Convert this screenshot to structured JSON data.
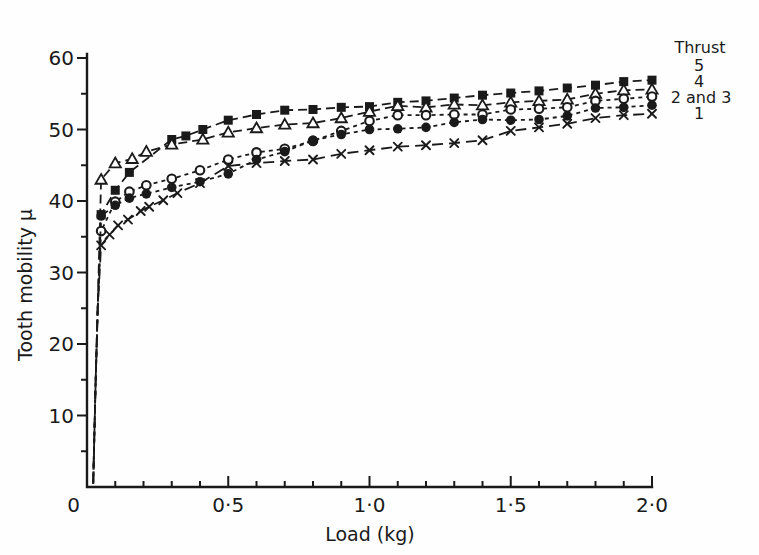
{
  "figure": {
    "background": "#fefefe",
    "ink_color": "#1a1a1a"
  },
  "legend": {
    "title": "Thrust",
    "entries": [
      {
        "label": "5"
      },
      {
        "label": "4"
      },
      {
        "label": "2 and 3"
      },
      {
        "label": "1"
      }
    ]
  },
  "axes": {
    "x": {
      "origin_label": "0",
      "major_tick_labels": [
        "0·5",
        "1·0",
        "1·5",
        "2·0"
      ],
      "major_ticks": [
        0.5,
        1.0,
        1.5,
        2.0
      ],
      "minor_tick_step": 0.1
    },
    "y": {
      "major_tick_labels": [
        "10",
        "20",
        "30",
        "40",
        "50",
        "60"
      ],
      "major_ticks": [
        10,
        20,
        30,
        40,
        50,
        60
      ],
      "minor_tick_step": 5
    }
  },
  "chart_data": {
    "type": "line",
    "title": "",
    "xlabel": "Load (kg)",
    "ylabel": "Tooth mobility μ",
    "xlim": [
      0,
      2.0
    ],
    "ylim": [
      0,
      60
    ],
    "grid": false,
    "legend_position": "top-right",
    "lead_in_points": [
      [
        0.022,
        0.5
      ],
      [
        0.03,
        14
      ],
      [
        0.038,
        25
      ]
    ],
    "series": [
      {
        "name": "Thrust 5",
        "legend_label": "5",
        "marker": "filled-square",
        "dash": [
          9,
          5
        ],
        "points": [
          [
            0.05,
            38.1
          ],
          [
            0.1,
            41.5
          ],
          [
            0.15,
            44.0
          ],
          [
            0.3,
            48.6
          ],
          [
            0.35,
            49.1
          ],
          [
            0.41,
            50.0
          ],
          [
            0.5,
            51.3
          ],
          [
            0.6,
            52.1
          ],
          [
            0.7,
            52.7
          ],
          [
            0.8,
            52.8
          ],
          [
            0.9,
            53.1
          ],
          [
            1.0,
            53.2
          ],
          [
            1.1,
            53.8
          ],
          [
            1.2,
            54.0
          ],
          [
            1.3,
            54.4
          ],
          [
            1.4,
            54.8
          ],
          [
            1.5,
            55.1
          ],
          [
            1.6,
            55.4
          ],
          [
            1.7,
            55.8
          ],
          [
            1.8,
            56.2
          ],
          [
            1.9,
            56.7
          ],
          [
            2.0,
            56.9
          ]
        ]
      },
      {
        "name": "Thrust 4",
        "legend_label": "4",
        "marker": "open-triangle",
        "dash": [
          9,
          5
        ],
        "points": [
          [
            0.05,
            43.0
          ],
          [
            0.1,
            45.3
          ],
          [
            0.16,
            45.9
          ],
          [
            0.21,
            46.9
          ],
          [
            0.3,
            47.9
          ],
          [
            0.41,
            48.6
          ],
          [
            0.5,
            49.6
          ],
          [
            0.6,
            50.2
          ],
          [
            0.7,
            50.7
          ],
          [
            0.8,
            50.9
          ],
          [
            0.9,
            51.6
          ],
          [
            1.0,
            52.5
          ],
          [
            1.1,
            53.3
          ],
          [
            1.2,
            53.1
          ],
          [
            1.3,
            53.5
          ],
          [
            1.4,
            53.4
          ],
          [
            1.5,
            53.8
          ],
          [
            1.6,
            54.0
          ],
          [
            1.7,
            54.2
          ],
          [
            1.8,
            55.0
          ],
          [
            1.9,
            55.5
          ],
          [
            2.0,
            55.6
          ]
        ]
      },
      {
        "name": "Thrust 2 and 3 (open circle)",
        "legend_label": "2 and 3",
        "marker": "open-circle",
        "dash": [
          4,
          4
        ],
        "points": [
          [
            0.05,
            35.8
          ],
          [
            0.1,
            39.9
          ],
          [
            0.15,
            41.3
          ],
          [
            0.21,
            42.2
          ],
          [
            0.3,
            43.1
          ],
          [
            0.4,
            44.3
          ],
          [
            0.5,
            45.8
          ],
          [
            0.6,
            46.8
          ],
          [
            0.7,
            47.3
          ],
          [
            0.8,
            48.4
          ],
          [
            0.9,
            49.8
          ],
          [
            1.0,
            51.2
          ],
          [
            1.1,
            52.0
          ],
          [
            1.2,
            52.0
          ],
          [
            1.3,
            52.1
          ],
          [
            1.4,
            52.1
          ],
          [
            1.5,
            52.8
          ],
          [
            1.6,
            52.9
          ],
          [
            1.7,
            53.1
          ],
          [
            1.8,
            54.0
          ],
          [
            1.9,
            54.3
          ],
          [
            2.0,
            54.6
          ]
        ]
      },
      {
        "name": "Thrust 2 and 3 (filled circle)",
        "legend_label": "2 and 3",
        "marker": "filled-circle",
        "dash": [
          4,
          4
        ],
        "points": [
          [
            0.05,
            37.9
          ],
          [
            0.1,
            39.4
          ],
          [
            0.15,
            40.4
          ],
          [
            0.21,
            41.0
          ],
          [
            0.3,
            41.9
          ],
          [
            0.4,
            42.7
          ],
          [
            0.5,
            43.8
          ],
          [
            0.6,
            45.8
          ],
          [
            0.7,
            46.9
          ],
          [
            0.8,
            48.5
          ],
          [
            0.9,
            49.3
          ],
          [
            1.0,
            50.0
          ],
          [
            1.1,
            50.1
          ],
          [
            1.2,
            50.3
          ],
          [
            1.3,
            51.0
          ],
          [
            1.4,
            51.4
          ],
          [
            1.5,
            51.3
          ],
          [
            1.6,
            51.4
          ],
          [
            1.7,
            51.9
          ],
          [
            1.8,
            53.0
          ],
          [
            1.9,
            53.1
          ],
          [
            2.0,
            53.4
          ]
        ]
      },
      {
        "name": "Thrust 1",
        "legend_label": "1",
        "marker": "cross",
        "dash": [
          11,
          6
        ],
        "points": [
          [
            0.05,
            33.8
          ],
          [
            0.08,
            35.3
          ],
          [
            0.11,
            36.6
          ],
          [
            0.145,
            37.4
          ],
          [
            0.19,
            38.6
          ],
          [
            0.22,
            39.2
          ],
          [
            0.27,
            40.1
          ],
          [
            0.32,
            41.1
          ],
          [
            0.4,
            42.5
          ],
          [
            0.5,
            44.9
          ],
          [
            0.6,
            45.3
          ],
          [
            0.7,
            45.6
          ],
          [
            0.8,
            45.8
          ],
          [
            0.9,
            46.6
          ],
          [
            1.0,
            47.1
          ],
          [
            1.1,
            47.6
          ],
          [
            1.2,
            47.8
          ],
          [
            1.3,
            48.1
          ],
          [
            1.4,
            48.5
          ],
          [
            1.5,
            49.8
          ],
          [
            1.6,
            50.3
          ],
          [
            1.7,
            50.8
          ],
          [
            1.8,
            51.6
          ],
          [
            1.9,
            52.0
          ],
          [
            2.0,
            52.2
          ]
        ]
      }
    ]
  }
}
